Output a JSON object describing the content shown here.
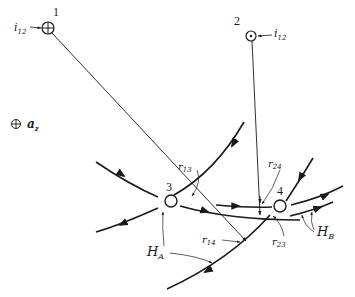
{
  "figure": {
    "wires": [
      {
        "id": "1",
        "label": "1",
        "current_label_base": "i",
        "current_label_sub": "12",
        "symbol": "cross-into-page"
      },
      {
        "id": "2",
        "label": "2",
        "current_label_base": "i",
        "current_label_sub": "12",
        "symbol": "dot-out-of-page"
      },
      {
        "id": "3",
        "label": "3",
        "symbol": "open-circle"
      },
      {
        "id": "4",
        "label": "4",
        "symbol": "open-circle"
      }
    ],
    "axis_marker": {
      "symbol": "cross-into-page",
      "label_base": "a",
      "label_sub": "z"
    },
    "distances": [
      {
        "base": "r",
        "sub": "13"
      },
      {
        "base": "r",
        "sub": "24"
      },
      {
        "base": "r",
        "sub": "14"
      },
      {
        "base": "r",
        "sub": "23"
      }
    ],
    "fields": [
      {
        "base": "H",
        "sub": "A"
      },
      {
        "base": "H",
        "sub": "B"
      }
    ],
    "colors": {
      "ink": "#1a1a1a",
      "background": "#ffffff"
    }
  }
}
